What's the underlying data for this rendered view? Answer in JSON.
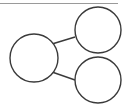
{
  "diagram": {
    "type": "tree",
    "colors": {
      "background": "#ffffff",
      "stroke": "#3a3a3a",
      "rule": "#9a9a9a"
    },
    "rule": {
      "x1": 0,
      "y1": 3.5,
      "x2": 118,
      "y2": 3.5
    },
    "nodes": [
      {
        "id": "root",
        "label": "",
        "cx": 34,
        "cy": 58,
        "r": 24
      },
      {
        "id": "child-top",
        "label": "",
        "cx": 98,
        "cy": 30,
        "r": 23
      },
      {
        "id": "child-bottom",
        "label": "",
        "cx": 98,
        "cy": 80,
        "r": 23
      }
    ],
    "edges": [
      {
        "from": "root",
        "to": "child-top",
        "x1": 52,
        "y1": 44,
        "x2": 75,
        "y2": 37
      },
      {
        "from": "root",
        "to": "child-bottom",
        "x1": 52,
        "y1": 72,
        "x2": 75,
        "y2": 80
      }
    ]
  }
}
